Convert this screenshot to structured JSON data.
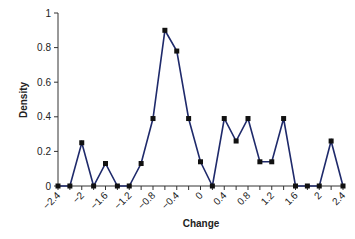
{
  "chart_data": {
    "type": "line",
    "title": "",
    "xlabel": "Change",
    "ylabel": "Density",
    "xlim": [
      -2.4,
      2.4
    ],
    "ylim": [
      0,
      1
    ],
    "grid": false,
    "legend": null,
    "x_tick_labels": [
      "-2.4",
      "-2",
      "-1.6",
      "-1.2",
      "-0.8",
      "-0.4",
      "0",
      "0.4",
      "0.8",
      "1.2",
      "1.6",
      "2",
      "2.4"
    ],
    "y_tick_labels": [
      "0",
      "0.2",
      "0.4",
      "0.6",
      "0.8",
      "1"
    ],
    "series": [
      {
        "name": "Density",
        "color": "#1f2a6b",
        "marker": "square",
        "x": [
          -2.4,
          -2.2,
          -2.0,
          -1.8,
          -1.6,
          -1.4,
          -1.2,
          -1.0,
          -0.8,
          -0.6,
          -0.4,
          -0.2,
          0.0,
          0.2,
          0.4,
          0.6,
          0.8,
          1.0,
          1.2,
          1.4,
          1.6,
          1.8,
          2.0,
          2.2,
          2.4
        ],
        "values": [
          0,
          0,
          0.25,
          0,
          0.13,
          0,
          0,
          0.13,
          0.39,
          0.9,
          0.78,
          0.39,
          0.14,
          0,
          0.39,
          0.26,
          0.39,
          0.14,
          0.14,
          0.39,
          0,
          0,
          0,
          0.26,
          0
        ]
      }
    ]
  }
}
